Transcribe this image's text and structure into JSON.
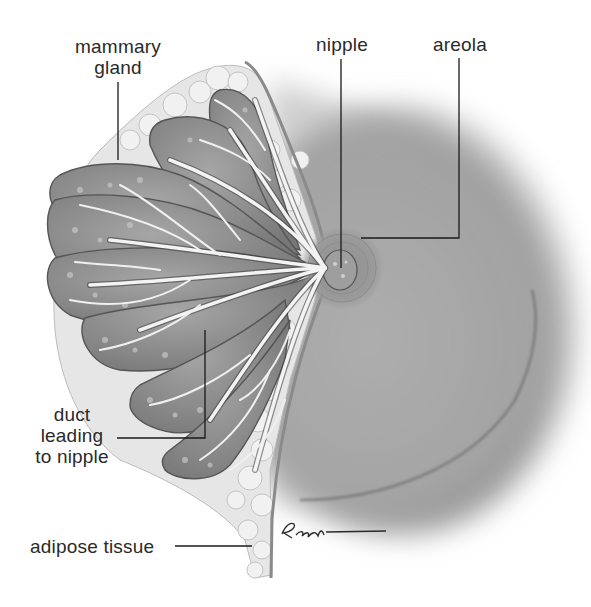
{
  "diagram": {
    "labels": {
      "mammary_gland": "mammary gland",
      "mammary_gland_line1": "mammary",
      "mammary_gland_line2": "gland",
      "nipple": "nipple",
      "areola": "areola",
      "duct_line1": "duct",
      "duct_line2": "leading",
      "duct_line3": "to nipple",
      "adipose_tissue": "adipose tissue"
    },
    "signature": "R.Ewin",
    "colors": {
      "background": "#ffffff",
      "label_text": "#2a2a2a",
      "leader_line": "#1a1a1a",
      "gland_lobe": "#8a8a8a",
      "duct": "#f2f2f2",
      "adipose": "#e4e4e4",
      "skin_shading": "#9c9c9c"
    }
  }
}
